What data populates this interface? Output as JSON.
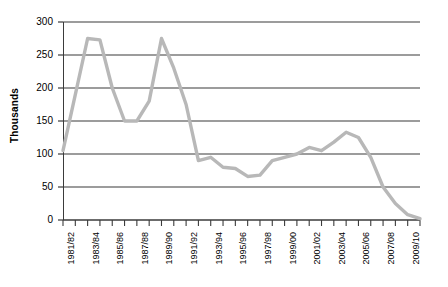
{
  "chart_data": {
    "type": "line",
    "title": "",
    "xlabel": "",
    "ylabel": "Thousands",
    "ylim": [
      0,
      300
    ],
    "yticks": [
      0,
      50,
      100,
      150,
      200,
      250,
      300
    ],
    "grid": true,
    "legend": "none",
    "line_color": "#b8b8b8",
    "axis_color": "#3b3b3b",
    "gridline_color": "#3b3b3b",
    "categories": [
      "1981/82",
      "1982/83",
      "1983/84",
      "1984/85",
      "1985/86",
      "1986/87",
      "1987/88",
      "1988/89",
      "1989/90",
      "1990/91",
      "1991/92",
      "1992/93",
      "1993/94",
      "1994/95",
      "1995/96",
      "1996/97",
      "1997/98",
      "1998/99",
      "1999/00",
      "2000/01",
      "2001/02",
      "2002/03",
      "2003/04",
      "2004/05",
      "2005/06",
      "2006/07",
      "2007/08",
      "2008/09",
      "2009/10",
      "2010/11"
    ],
    "xtick_labels_shown": [
      "1981/82",
      "1983/84",
      "1985/86",
      "1987/88",
      "1989/90",
      "1991/92",
      "1993/94",
      "1995/96",
      "1997/98",
      "1999/00",
      "2001/02",
      "2003/04",
      "2005/06",
      "2007/08",
      "2009/10"
    ],
    "values": [
      105,
      190,
      275,
      273,
      200,
      150,
      150,
      180,
      275,
      230,
      175,
      90,
      95,
      80,
      78,
      66,
      68,
      90,
      95,
      100,
      110,
      105,
      118,
      133,
      125,
      95,
      50,
      25,
      8,
      2
    ],
    "values_unit": "thousands"
  }
}
